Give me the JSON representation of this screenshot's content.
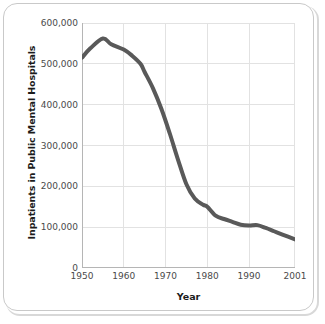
{
  "figure": {
    "background_color": "#ffffff",
    "frame_color": "#c9c9c9"
  },
  "chart_data": {
    "type": "line",
    "title": "",
    "xlabel": "Year",
    "ylabel": "Inpatients in Public Mental Hospitals",
    "xlim": [
      1950,
      2001
    ],
    "ylim": [
      0,
      600000
    ],
    "grid": true,
    "legend": false,
    "line_color": "#595959",
    "line_width": 4,
    "grid_color": "#e2e2e2",
    "axis_color": "#b5b5b5",
    "x_tick_labels": [
      "1950",
      "1960",
      "1970",
      "1980",
      "1990",
      "2001"
    ],
    "x_tick_values": [
      1950,
      1960,
      1970,
      1980,
      1990,
      2001
    ],
    "y_tick_labels": [
      "0",
      "100,000",
      "200,000",
      "300,000",
      "400,000",
      "500,000",
      "600,000"
    ],
    "y_tick_values": [
      0,
      100000,
      200000,
      300000,
      400000,
      500000,
      600000
    ],
    "series": [
      {
        "name": "Inpatients in Public Mental Hospitals",
        "x": [
          1950,
          1952,
          1955,
          1957,
          1960,
          1962,
          1964,
          1965,
          1967,
          1969,
          1971,
          1973,
          1975,
          1977,
          1979,
          1980,
          1982,
          1984,
          1986,
          1988,
          1990,
          1992,
          1994,
          1996,
          1998,
          2001
        ],
        "values": [
          515000,
          538000,
          562000,
          548000,
          535000,
          520000,
          500000,
          480000,
          440000,
          390000,
          330000,
          265000,
          205000,
          170000,
          155000,
          150000,
          128000,
          120000,
          113000,
          106000,
          104000,
          105000,
          98000,
          90000,
          82000,
          70000
        ]
      }
    ]
  }
}
